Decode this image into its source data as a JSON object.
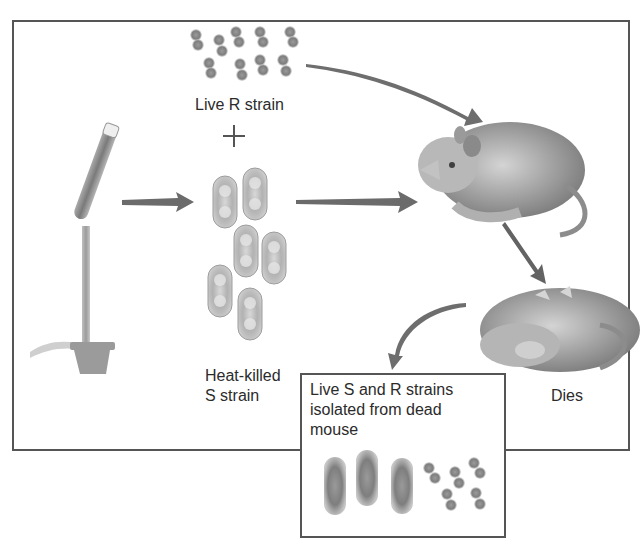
{
  "diagram": {
    "labels": {
      "live_r_strain": "Live R strain",
      "plus_sign": "+",
      "heat_killed_s_strain": "Heat-killed\nS strain",
      "dies": "Dies",
      "isolated_result": "Live S and R strains\nisolated from dead\nmouse"
    },
    "elements": {
      "r_strain_bacteria": {
        "shape": "small paired cocci (diplococci)",
        "count": 10
      },
      "s_strain_bacteria": {
        "shape": "large encapsulated paired cells",
        "count": 6
      },
      "burner": "Bunsen burner heating test tube",
      "live_mouse": "live mouse receiving injection",
      "dead_mouse": "dead mouse lying on back",
      "result_bacteria": {
        "s_count": 3,
        "r_count": 5
      }
    },
    "flow": [
      "Bunsen burner -> Heat-killed S strain",
      "Live R strain + Heat-killed S strain -> Mouse",
      "Mouse -> Dies",
      "Dead mouse -> Live S and R strains isolated"
    ],
    "colors": {
      "frame": "#555555",
      "arrow": "#6b6b6b",
      "bacteria": "#8a8a8a",
      "text": "#2b2b2b"
    }
  }
}
